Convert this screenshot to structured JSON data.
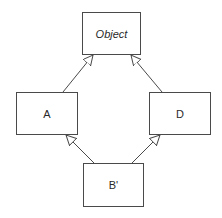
{
  "diagram": {
    "type": "class-inheritance",
    "nodes": [
      {
        "id": "object",
        "label": "Object",
        "italic": true
      },
      {
        "id": "a",
        "label": "A",
        "italic": false
      },
      {
        "id": "d",
        "label": "D",
        "italic": false
      },
      {
        "id": "b_prime",
        "label": "B'",
        "italic": false
      }
    ],
    "edges": [
      {
        "from": "a",
        "to": "object",
        "arrow": "hollow-triangle"
      },
      {
        "from": "d",
        "to": "object",
        "arrow": "hollow-triangle"
      },
      {
        "from": "b_prime",
        "to": "a",
        "arrow": "hollow-triangle"
      },
      {
        "from": "b_prime",
        "to": "d",
        "arrow": "hollow-triangle"
      }
    ],
    "colors": {
      "line": "#4a4a4a",
      "background": "#ffffff"
    }
  }
}
